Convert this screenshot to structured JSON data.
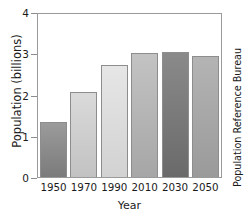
{
  "chart_data": {
    "type": "bar",
    "title": "World Population",
    "xlabel": "Year",
    "ylabel": "Population (billions)",
    "categories": [
      "1950",
      "1970",
      "1990",
      "2010",
      "2030",
      "2050"
    ],
    "values": [
      1.33,
      2.05,
      2.72,
      3.0,
      3.03,
      2.93
    ],
    "ylim": [
      0,
      4
    ],
    "yticks": [
      "0",
      "1",
      "2",
      "3",
      "4"
    ],
    "ytick_values": [
      0,
      1,
      2,
      3,
      4
    ],
    "grid": false,
    "legend": null,
    "annotation": "Population Reference Bureau",
    "bar_colors_top": [
      "#9b9b9b",
      "#dadada",
      "#e6e6e6",
      "#c3c3c3",
      "#8a8a8a",
      "#b4b4b4"
    ],
    "bar_colors_bottom": [
      "#7b7b7b",
      "#c2c2c2",
      "#d2d2d2",
      "#a6a6a6",
      "#6a6a6a",
      "#9a9a9a"
    ],
    "frame_color": "#9a9a9a"
  }
}
